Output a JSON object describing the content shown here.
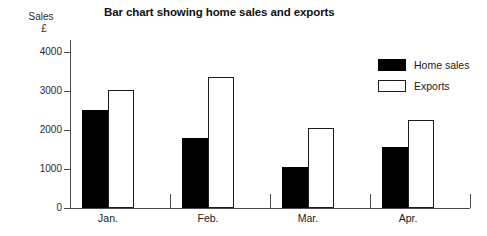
{
  "chart_data": {
    "type": "bar",
    "title": "Bar chart showing home sales and exports",
    "xlabel": "",
    "ylabel": "Sales\n£",
    "ylabel_line1": "Sales",
    "ylabel_line2": "£",
    "categories": [
      "Jan.",
      "Feb.",
      "Mar.",
      "Apr."
    ],
    "series": [
      {
        "name": "Home sales",
        "color": "#000000",
        "values": [
          2520,
          1790,
          1050,
          1550
        ]
      },
      {
        "name": "Exports",
        "color": "#ffffff",
        "values": [
          3010,
          3350,
          2040,
          2250
        ]
      }
    ],
    "ylim": [
      0,
      4300
    ],
    "yticks": [
      0,
      1000,
      2000,
      3000,
      4000
    ],
    "ytick_labels": [
      "0",
      "1000",
      "2000",
      "3000",
      "4000"
    ],
    "grid": false,
    "legend_position": "right"
  },
  "legend": {
    "items": [
      {
        "label": "Home sales",
        "swatch": "filled-black"
      },
      {
        "label": "Exports",
        "swatch": "outlined-white"
      }
    ]
  }
}
